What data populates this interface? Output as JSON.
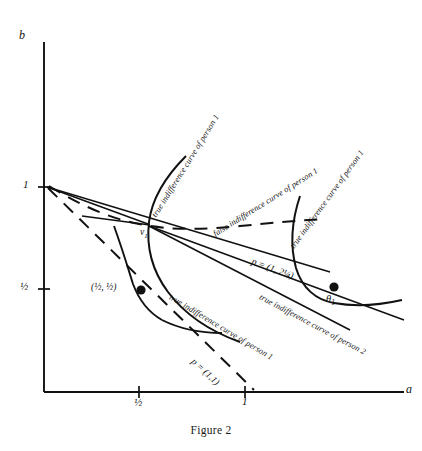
{
  "figure": {
    "caption": "Figure 2",
    "axes": {
      "x_label": "a",
      "y_label": "b",
      "x_ticks": [
        {
          "value": "½",
          "pos": 0.5
        },
        {
          "value": "1",
          "pos": 1.0
        }
      ],
      "y_ticks": [
        {
          "value": "1",
          "pos": 1.0
        },
        {
          "value": "½",
          "pos": 0.5
        }
      ]
    },
    "point_labels": [
      {
        "id": "v1",
        "text": "v",
        "subscript": "1"
      },
      {
        "id": "theta1",
        "text": "θ",
        "subscript": "1"
      },
      {
        "id": "half-half",
        "text": "(½, ½)"
      }
    ],
    "price_labels": [
      {
        "id": "p-1-225",
        "text": "p = (1, 2¼)"
      },
      {
        "id": "p-1-1",
        "text": "p = (1,1)"
      }
    ],
    "curve_labels": [
      {
        "id": "true-1-upper",
        "text": "true indifference curve of person 1"
      },
      {
        "id": "false-1",
        "text": "false indifference curve of person 1"
      },
      {
        "id": "true-1-right",
        "text": "true indifference curve of person 1"
      },
      {
        "id": "true-1-mid",
        "text": "true indifference curve of person 1"
      },
      {
        "id": "true-2",
        "text": "true indifference curve of person 2"
      }
    ],
    "colors": {
      "ink": "#111111",
      "background": "#ffffff"
    }
  }
}
